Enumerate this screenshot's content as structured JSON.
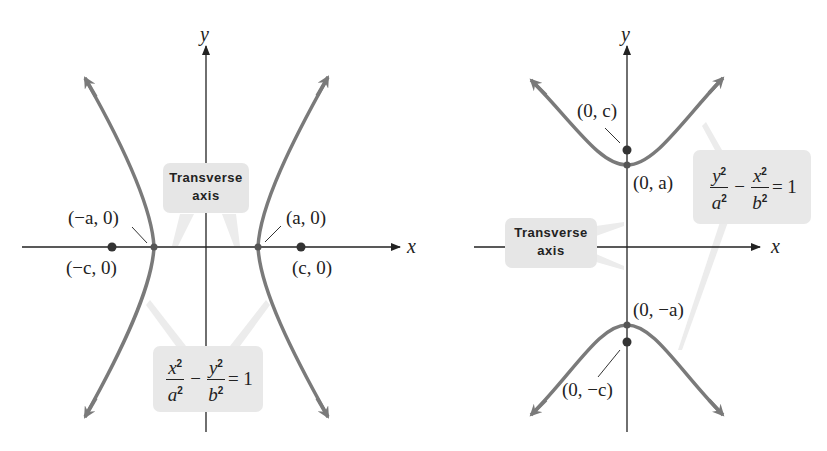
{
  "figure": {
    "left_panel": {
      "axis_labels": {
        "x": "x",
        "y": "y"
      },
      "callout_transverse": {
        "line1": "Transverse",
        "line2": "axis"
      },
      "points": {
        "neg_vertex": "(−a, 0)",
        "pos_vertex": "(a, 0)",
        "neg_focus": "(−c, 0)",
        "pos_focus": "(c, 0)"
      },
      "equation": {
        "term1_num": "x",
        "term1_den": "a",
        "operator": "−",
        "term2_num": "y",
        "term2_den": "b",
        "exponent": "2",
        "rhs": "= 1"
      }
    },
    "right_panel": {
      "axis_labels": {
        "x": "x",
        "y": "y"
      },
      "callout_transverse": {
        "line1": "Transverse",
        "line2": "axis"
      },
      "points": {
        "pos_focus": "(0, c)",
        "pos_vertex": "(0, a)",
        "neg_vertex": "(0, −a)",
        "neg_focus": "(0, −c)"
      },
      "equation": {
        "term1_num": "y",
        "term1_den": "a",
        "operator": "−",
        "term2_num": "x",
        "term2_den": "b",
        "exponent": "2",
        "rhs": "= 1"
      }
    },
    "colors": {
      "curve": "#7a7a7a",
      "axis": "#222222",
      "callout_bg": "#e6e6e6",
      "leader": "#e2e2e2",
      "point": "#333333"
    }
  }
}
